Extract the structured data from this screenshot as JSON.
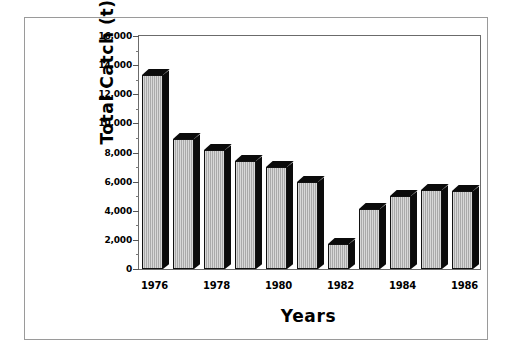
{
  "chart_data": {
    "type": "bar",
    "title": "",
    "xlabel": "Years",
    "ylabel": "Total Catch (t)",
    "categories": [
      "1976",
      "1977",
      "1978",
      "1979",
      "1980",
      "1981",
      "1982",
      "1983",
      "1984",
      "1985",
      "1986"
    ],
    "values": [
      13300,
      8900,
      8200,
      7400,
      7000,
      5950,
      1750,
      4100,
      5000,
      5400,
      5350
    ],
    "ylim": [
      0,
      16000
    ],
    "ytick_labels": [
      "16,000",
      "14,000",
      "12,000",
      "10,000",
      "8,000",
      "6,000",
      "4,000",
      "2,000",
      "0"
    ],
    "ytick_values": [
      16000,
      14000,
      12000,
      10000,
      8000,
      6000,
      4000,
      2000,
      0
    ],
    "ytick_minor_values": [
      15000,
      13000,
      11000,
      9000,
      7000,
      5000,
      3000,
      1000
    ],
    "xtick_labels": [
      "1976",
      "1978",
      "1980",
      "1982",
      "1984",
      "1986"
    ],
    "xtick_categories": [
      "1976",
      "1978",
      "1980",
      "1982",
      "1984",
      "1986"
    ],
    "grid": false,
    "legend": null,
    "legend_position": "none",
    "bar_style": "3d-shadow",
    "colors": {
      "bar_face": "#a9a9a9",
      "bar_shadow": "#0b0b0b",
      "axis": "#6b6b6b",
      "frame": "#9a9a9a",
      "text": "#000000",
      "background": "#ffffff"
    }
  }
}
